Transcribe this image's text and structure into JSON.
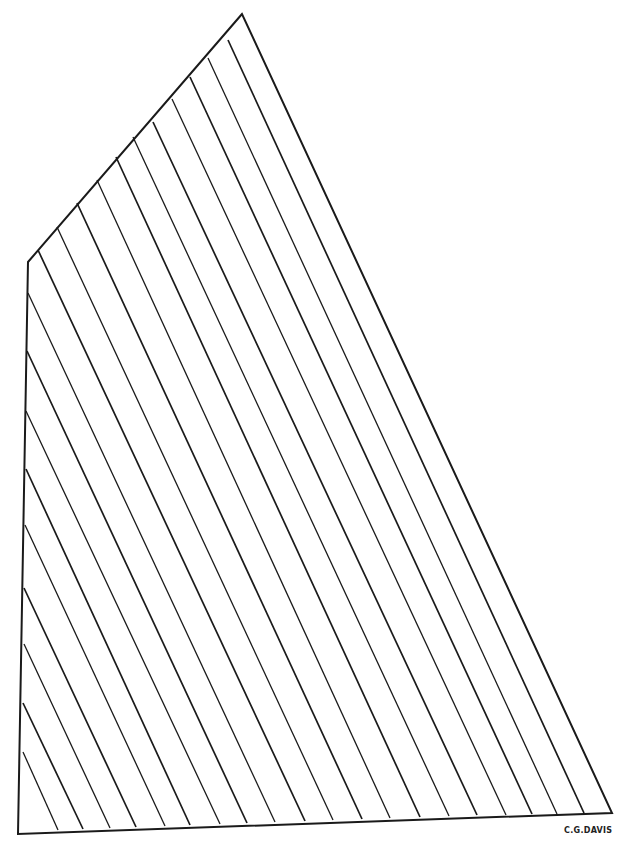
{
  "diagram": {
    "stroke_color": "#1a1a1a",
    "background": "#ffffff",
    "outline": {
      "peak": [
        242,
        14
      ],
      "throat": [
        28,
        262
      ],
      "tack": [
        18,
        834
      ],
      "clew": [
        612,
        813
      ]
    },
    "seams": [
      {
        "from": [
          23,
          752
        ],
        "to": [
          58,
          830
        ]
      },
      {
        "from": [
          23,
          703
        ],
        "to": [
          83,
          829
        ]
      },
      {
        "from": [
          24,
          644
        ],
        "to": [
          110,
          828
        ]
      },
      {
        "from": [
          24,
          588
        ],
        "to": [
          136,
          827
        ]
      },
      {
        "from": [
          25,
          525
        ],
        "to": [
          165,
          826
        ]
      },
      {
        "from": [
          26,
          469
        ],
        "to": [
          190,
          825
        ]
      },
      {
        "from": [
          26,
          411
        ],
        "to": [
          220,
          824
        ]
      },
      {
        "from": [
          27,
          351
        ],
        "to": [
          247,
          823
        ]
      },
      {
        "from": [
          28,
          293
        ],
        "to": [
          275,
          822
        ]
      },
      {
        "from": [
          38,
          250
        ],
        "to": [
          305,
          821
        ]
      },
      {
        "from": [
          57,
          227
        ],
        "to": [
          333,
          820
        ]
      },
      {
        "from": [
          77,
          203
        ],
        "to": [
          362,
          819
        ]
      },
      {
        "from": [
          97,
          180
        ],
        "to": [
          390,
          818
        ]
      },
      {
        "from": [
          116,
          157
        ],
        "to": [
          420,
          817
        ]
      },
      {
        "from": [
          133,
          137
        ],
        "to": [
          449,
          816
        ]
      },
      {
        "from": [
          153,
          122
        ],
        "to": [
          477,
          815
        ]
      },
      {
        "from": [
          172,
          99
        ],
        "to": [
          506,
          815
        ]
      },
      {
        "from": [
          190,
          77
        ],
        "to": [
          532,
          814
        ]
      },
      {
        "from": [
          208,
          58
        ],
        "to": [
          557,
          814
        ]
      },
      {
        "from": [
          228,
          40
        ],
        "to": [
          584,
          813
        ]
      }
    ]
  },
  "signature": "C.G.DAVIS"
}
